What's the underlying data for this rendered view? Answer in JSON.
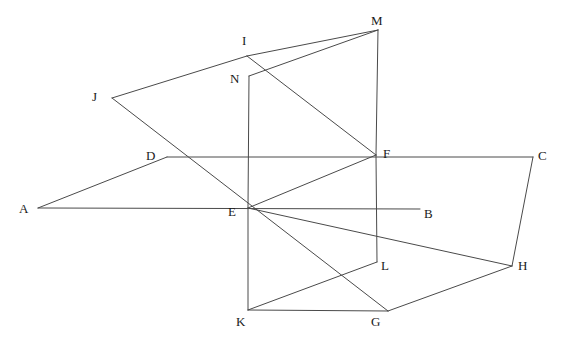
{
  "figure": {
    "width": 569,
    "height": 347,
    "background_color": "#ffffff",
    "stroke_color": "#4a4a4a",
    "stroke_width": 1,
    "label_color": "#1a1a1a",
    "label_font_size": 13
  },
  "points": {
    "A": {
      "label": "A",
      "x": 38,
      "y": 208,
      "label_x": 19,
      "label_y": 202
    },
    "B": {
      "label": "B",
      "x": 420,
      "y": 209,
      "label_x": 424,
      "label_y": 207
    },
    "C": {
      "label": "C",
      "x": 533,
      "y": 157,
      "label_x": 538,
      "label_y": 149
    },
    "D": {
      "label": "D",
      "x": 167,
      "y": 157,
      "label_x": 146,
      "label_y": 149
    },
    "E": {
      "label": "E",
      "x": 248,
      "y": 208,
      "label_x": 228,
      "label_y": 205
    },
    "F": {
      "label": "F",
      "x": 376,
      "y": 155,
      "label_x": 383,
      "label_y": 147
    },
    "G": {
      "label": "G",
      "x": 388,
      "y": 311,
      "label_x": 371,
      "label_y": 315
    },
    "H": {
      "label": "H",
      "x": 512,
      "y": 266,
      "label_x": 518,
      "label_y": 259
    },
    "I": {
      "label": "I",
      "x": 247,
      "y": 56,
      "label_x": 242,
      "label_y": 34
    },
    "J": {
      "label": "J",
      "x": 112,
      "y": 98,
      "label_x": 92,
      "label_y": 90
    },
    "K": {
      "label": "K",
      "x": 248,
      "y": 310,
      "label_x": 236,
      "label_y": 315
    },
    "L": {
      "label": "L",
      "x": 377,
      "y": 262,
      "label_x": 381,
      "label_y": 259
    },
    "M": {
      "label": "M",
      "x": 378,
      "y": 30,
      "label_x": 371,
      "label_y": 14
    },
    "N": {
      "label": "N",
      "x": 249,
      "y": 76,
      "label_x": 230,
      "label_y": 72
    }
  },
  "segments": [
    {
      "name": "segment-A-D",
      "from": "A",
      "to": "D"
    },
    {
      "name": "segment-D-C",
      "from": "D",
      "to": "C"
    },
    {
      "name": "segment-A-B",
      "from": "A",
      "to": "B"
    },
    {
      "name": "segment-C-H",
      "from": "C",
      "to": "H"
    },
    {
      "name": "segment-J-I",
      "from": "J",
      "to": "I"
    },
    {
      "name": "segment-I-M",
      "from": "I",
      "to": "M"
    },
    {
      "name": "segment-J-G",
      "from": "J",
      "to": "G"
    },
    {
      "name": "segment-I-F",
      "from": "I",
      "to": "F"
    },
    {
      "name": "segment-M-F",
      "from": "M",
      "to": "F"
    },
    {
      "name": "segment-F-L",
      "from": "F",
      "to": "L"
    },
    {
      "name": "segment-N-E",
      "from": "N",
      "to": "E"
    },
    {
      "name": "segment-E-K",
      "from": "E",
      "to": "K"
    },
    {
      "name": "segment-N-M",
      "from": "N",
      "to": "M"
    },
    {
      "name": "segment-E-F",
      "from": "E",
      "to": "F"
    },
    {
      "name": "segment-K-G",
      "from": "K",
      "to": "G"
    },
    {
      "name": "segment-G-H",
      "from": "G",
      "to": "H"
    },
    {
      "name": "segment-E-H",
      "from": "E",
      "to": "H"
    },
    {
      "name": "segment-L-K",
      "from": "L",
      "to": "K"
    }
  ],
  "vertex_order": [
    "A",
    "B",
    "C",
    "D",
    "E",
    "F",
    "G",
    "H",
    "I",
    "J",
    "K",
    "L",
    "M",
    "N"
  ]
}
